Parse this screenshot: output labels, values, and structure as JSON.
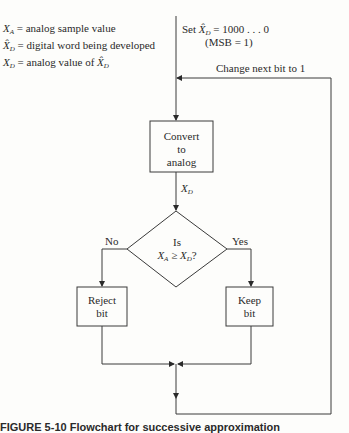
{
  "legend": [
    {
      "symbol": "X_A",
      "text": "= analog sample value"
    },
    {
      "symbol": "X̂_D",
      "text": "= digital word being developed"
    },
    {
      "symbol": "X_D",
      "text": "= analog value of X̂_D"
    }
  ],
  "start": {
    "line1": "Set X̂_D = 1000 . . . 0",
    "line2": "(MSB = 1)"
  },
  "feedback_label": "Change next bit to 1",
  "convert_box": {
    "line1": "Convert",
    "line2": "to",
    "line3": "analog"
  },
  "convert_output_label": "X_D",
  "decision": {
    "line1": "Is",
    "line2": "X_A ≥ X_D?"
  },
  "branches": {
    "no": "No",
    "yes": "Yes"
  },
  "reject_box": {
    "line1": "Reject",
    "line2": "bit"
  },
  "keep_box": {
    "line1": "Keep",
    "line2": "bit"
  },
  "caption": "FIGURE 5-10  Flowchart for successive approximation"
}
